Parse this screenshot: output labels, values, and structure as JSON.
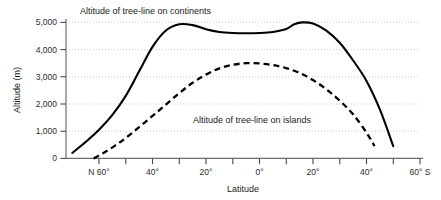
{
  "chart_data": {
    "type": "line",
    "title": "",
    "xlabel": "Latitude",
    "ylabel": "Altitude (m)",
    "xlim": [
      70,
      -60
    ],
    "ylim": [
      0,
      5000
    ],
    "grid": true,
    "legend_position": "inline-annotations",
    "y_ticks": [
      0,
      1000,
      2000,
      3000,
      4000,
      5000
    ],
    "y_tick_labels": [
      "0",
      "1,000",
      "2,000",
      "3,000",
      "4,000",
      "5,000"
    ],
    "x_ticks": [
      60,
      50,
      40,
      30,
      20,
      10,
      0,
      -10,
      -20,
      -30,
      -40,
      -50,
      -60
    ],
    "x_tick_labels": [
      "N 60°",
      "",
      "40°",
      "",
      "20°",
      "",
      "0°",
      "",
      "20°",
      "",
      "40°",
      "",
      "60° S"
    ],
    "series": [
      {
        "name": "Altitude of tree-line on continents",
        "style": "solid",
        "color": "#000000",
        "annotation": "Altitude of tree-line on continents",
        "x": [
          70,
          65,
          60,
          55,
          50,
          45,
          40,
          35,
          30,
          25,
          20,
          15,
          10,
          5,
          0,
          -5,
          -10,
          -13,
          -16,
          -20,
          -25,
          -30,
          -35,
          -40,
          -45,
          -50
        ],
        "y": [
          200,
          600,
          1050,
          1600,
          2300,
          3200,
          4100,
          4700,
          4930,
          4900,
          4750,
          4650,
          4610,
          4600,
          4610,
          4650,
          4760,
          4930,
          5000,
          4960,
          4700,
          4250,
          3600,
          2850,
          1800,
          450
        ]
      },
      {
        "name": "Altitude of tree-line on islands",
        "style": "dashed",
        "color": "#000000",
        "annotation": "Altitude of tree-line on islands",
        "x": [
          62,
          58,
          54,
          50,
          45,
          40,
          35,
          30,
          25,
          20,
          15,
          10,
          5,
          0,
          -5,
          -10,
          -15,
          -20,
          -25,
          -30,
          -35,
          -40,
          -43
        ],
        "y": [
          0,
          220,
          470,
          750,
          1150,
          1560,
          1980,
          2400,
          2780,
          3080,
          3310,
          3440,
          3500,
          3490,
          3430,
          3320,
          3140,
          2880,
          2540,
          2120,
          1620,
          950,
          450
        ]
      }
    ],
    "annotations": [
      {
        "text": "Altitude of tree-line on continents",
        "x_px": 80,
        "y_px": 13
      },
      {
        "text": "Altitude of tree-line on islands",
        "x_px": 193,
        "y_px": 120
      }
    ]
  },
  "axes": {
    "y_title": "Altitude (m)",
    "x_title": "Latitude",
    "y_labels": [
      "5,000",
      "4,000",
      "3,000",
      "2,000",
      "1,000",
      "0"
    ],
    "x_labels": [
      "N 60°",
      "40°",
      "20°",
      "0°",
      "20°",
      "40°",
      "60° S"
    ]
  },
  "colors": {
    "line": "#000000",
    "grid": "#b9b9b9",
    "axis": "#5a5a5a",
    "text": "#1a1a1a",
    "background": "#ffffff"
  }
}
